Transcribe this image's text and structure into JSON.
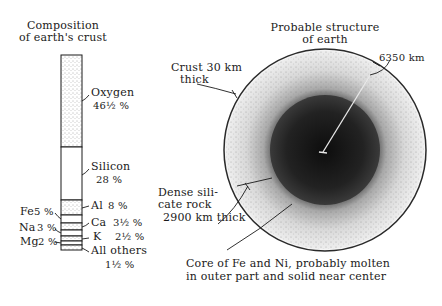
{
  "crust_column": {
    "title_line1": "Composition",
    "title_line2": "of earth's crust",
    "segments": [
      {
        "element": "Oxygen",
        "label": "Oxygen",
        "value": "46½ %",
        "percent": 46.5,
        "fill": "stippled-light"
      },
      {
        "element": "Silicon",
        "label": "Silicon",
        "value": "28 %",
        "percent": 28,
        "fill": "white"
      },
      {
        "element": "Al",
        "label": "Al",
        "value": "8 %",
        "percent": 8,
        "fill": "stippled-light"
      },
      {
        "element": "Fe",
        "label": "Fe",
        "value": "5 %",
        "percent": 5,
        "fill": "white"
      },
      {
        "element": "Ca",
        "label": "Ca",
        "value": "3½ %",
        "percent": 3.5,
        "fill": "stippled-light"
      },
      {
        "element": "Na",
        "label": "Na",
        "value": "3 %",
        "percent": 3,
        "fill": "white"
      },
      {
        "element": "K",
        "label": "K",
        "value": "2½ %",
        "percent": 2.5,
        "fill": "stippled-light"
      },
      {
        "element": "Mg",
        "label": "Mg",
        "value": "2 %",
        "percent": 2,
        "fill": "white"
      },
      {
        "element": "All others",
        "label": "All others",
        "value": "1½ %",
        "percent": 1.5,
        "fill": "stippled-light"
      }
    ]
  },
  "earth_structure": {
    "title_line1": "Probable structure",
    "title_line2": "of earth",
    "radius_label": "6350 km",
    "crust_label_line1": "Crust 30 km",
    "crust_label_line2": "thick",
    "mantle_label_line1": "Dense sili-",
    "mantle_label_line2": "cate rock",
    "mantle_label_line3": "2900 km thick",
    "core_label_line1": "Core of Fe and Ni, probably molten",
    "core_label_line2": "in outer part and solid near center"
  },
  "colors": {
    "ink": "#1a1a1a",
    "paper": "#ffffff",
    "stipple_light": "#c9c9c9",
    "core_dark": "#1c1c1c"
  }
}
